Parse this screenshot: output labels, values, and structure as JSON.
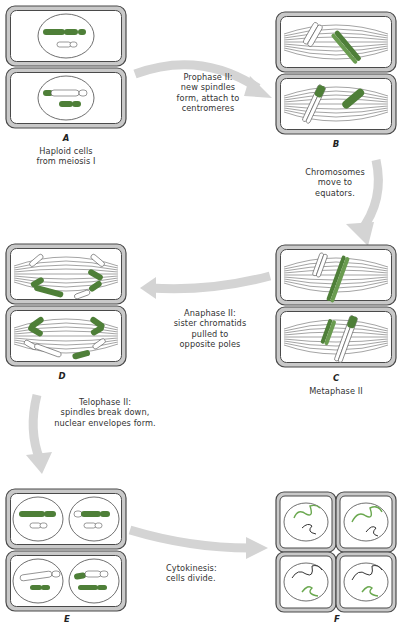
{
  "colors": {
    "chromosome_green": "#4e7f38",
    "chromosome_green_light": "#8fc174",
    "cell_wall_fill": "#c9c9c9",
    "cell_wall_stroke": "#4a4a4a",
    "arrow_gray": "#d4d4d4",
    "spindle": "#666666"
  },
  "panels": [
    {
      "id": "A",
      "letter": "A",
      "caption_lines": [
        "Haploid cells",
        "from meiosis I"
      ],
      "stage": "haploid-cells"
    },
    {
      "id": "B",
      "letter": "B",
      "caption_lines": [],
      "stage": "prophase-ii"
    },
    {
      "id": "C",
      "letter": "C",
      "caption_lines": [
        "Metaphase II"
      ],
      "stage": "metaphase-ii"
    },
    {
      "id": "D",
      "letter": "D",
      "caption_lines": [],
      "stage": "anaphase-ii"
    },
    {
      "id": "E",
      "letter": "E",
      "caption_lines": [],
      "stage": "telophase-ii"
    },
    {
      "id": "F",
      "letter": "F",
      "caption_lines": [],
      "stage": "cytokinesis"
    }
  ],
  "arrows": [
    {
      "from": "A",
      "to": "B",
      "label_lines": [
        "Prophase II:",
        "new spindles",
        "form, attach to",
        "centromeres"
      ]
    },
    {
      "from": "B",
      "to": "C",
      "label_lines": [
        "Chromosomes",
        "move to",
        "equators."
      ]
    },
    {
      "from": "C",
      "to": "D",
      "label_lines": [
        "Anaphase II:",
        "sister chromatids",
        "pulled to",
        "opposite poles"
      ]
    },
    {
      "from": "D",
      "to": "E",
      "label_lines": [
        "Telophase II:",
        "spindles break down,",
        "nuclear envelopes form."
      ]
    },
    {
      "from": "E",
      "to": "F",
      "label_lines": [
        "Cytokinesis:",
        "cells divide."
      ]
    }
  ]
}
